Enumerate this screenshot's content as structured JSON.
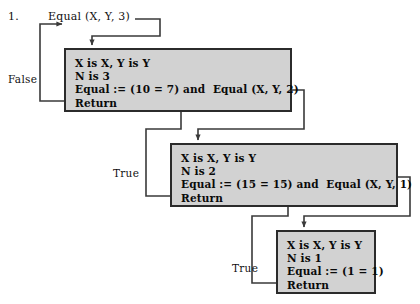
{
  "diagram": {
    "item_number": "1.",
    "root_call": "Equal (X, Y, 3)",
    "branch_labels": {
      "false": "False",
      "true_middle": "True",
      "true_bottom": "True"
    },
    "frames": [
      {
        "id": "frame-n3",
        "lines": [
          "X is X, Y is Y",
          "N is 3",
          "Equal := (10 = 7) and  Equal (X, Y, 2)",
          "Return"
        ]
      },
      {
        "id": "frame-n2",
        "lines": [
          "X is X, Y is Y",
          "N is 2",
          "Equal := (15 = 15) and  Equal (X, Y, 1)",
          "Return"
        ]
      },
      {
        "id": "frame-n1",
        "lines": [
          "X is X, Y is Y",
          "N is 1",
          "Equal := (1 = 1)",
          "Return"
        ]
      }
    ],
    "colors": {
      "box_fill": "#d2d2d2",
      "box_border": "#2b2b2b",
      "wire": "#3a3a3a",
      "text": "#0a0a0a",
      "background": "#ffffff"
    }
  }
}
